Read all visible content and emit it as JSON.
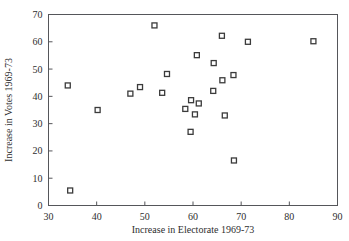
{
  "chart_data": {
    "type": "scatter",
    "title": "",
    "xlabel": "Increase in Electorate 1969-73",
    "ylabel": "Increase in Votes 1969-73",
    "xlim": [
      30,
      90
    ],
    "ylim": [
      0,
      70
    ],
    "xticks": [
      30,
      40,
      50,
      60,
      70,
      80,
      90
    ],
    "yticks": [
      0,
      10,
      20,
      30,
      40,
      50,
      60,
      70
    ],
    "xtick_labels": [
      "30",
      "40",
      "50",
      "60",
      "70",
      "80",
      "90"
    ],
    "ytick_labels": [
      "0",
      "10",
      "20",
      "30",
      "40",
      "50",
      "60",
      "70"
    ],
    "grid": false,
    "legend": false,
    "marker": "open-square",
    "marker_color": "#3b3b3b",
    "points": [
      {
        "x": 34.0,
        "y": 44.0
      },
      {
        "x": 34.5,
        "y": 5.5
      },
      {
        "x": 40.2,
        "y": 35.0
      },
      {
        "x": 47.0,
        "y": 41.0
      },
      {
        "x": 49.0,
        "y": 43.4
      },
      {
        "x": 52.0,
        "y": 66.0
      },
      {
        "x": 53.6,
        "y": 41.3
      },
      {
        "x": 54.6,
        "y": 48.2
      },
      {
        "x": 58.4,
        "y": 35.4
      },
      {
        "x": 59.6,
        "y": 38.6
      },
      {
        "x": 59.5,
        "y": 27.0
      },
      {
        "x": 60.4,
        "y": 33.4
      },
      {
        "x": 61.2,
        "y": 37.4
      },
      {
        "x": 60.8,
        "y": 55.1
      },
      {
        "x": 64.3,
        "y": 52.2
      },
      {
        "x": 64.2,
        "y": 42.0
      },
      {
        "x": 66.0,
        "y": 62.2
      },
      {
        "x": 66.1,
        "y": 45.9
      },
      {
        "x": 66.6,
        "y": 33.0
      },
      {
        "x": 68.4,
        "y": 47.8
      },
      {
        "x": 68.5,
        "y": 16.5
      },
      {
        "x": 71.4,
        "y": 60.0
      },
      {
        "x": 85.0,
        "y": 60.2
      }
    ]
  }
}
